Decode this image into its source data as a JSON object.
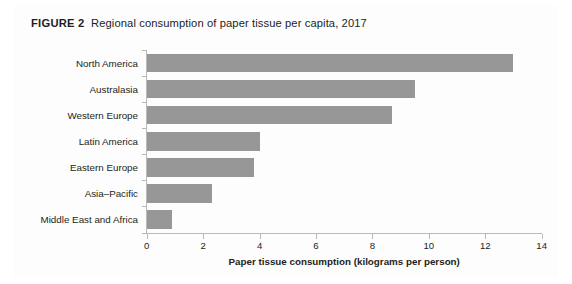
{
  "figure": {
    "label": "FIGURE 2",
    "caption": "Regional consumption of paper tissue per capita, 2017"
  },
  "chart_data": {
    "type": "bar",
    "orientation": "horizontal",
    "categories": [
      "North America",
      "Australasia",
      "Western Europe",
      "Latin America",
      "Eastern Europe",
      "Asia–Pacific",
      "Middle East and Africa"
    ],
    "values": [
      13.0,
      9.5,
      8.7,
      4.0,
      3.8,
      2.3,
      0.9
    ],
    "xlabel": "Paper tissue consumption (kilograms per person)",
    "ylabel": "",
    "xlim": [
      0,
      14
    ],
    "xticks": [
      0,
      2,
      4,
      6,
      8,
      10,
      12,
      14
    ],
    "xtick_labels": [
      "0",
      "2",
      "4",
      "6",
      "8",
      "10",
      "12",
      "14"
    ],
    "grid": false,
    "legend": false,
    "bar_color": "#979797",
    "axis_color": "#b9b9b9",
    "background": "#ffffff"
  }
}
